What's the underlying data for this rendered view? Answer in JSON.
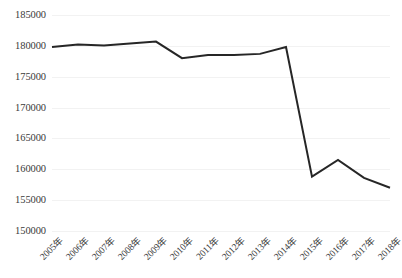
{
  "chart_data": {
    "type": "line",
    "title": "",
    "xlabel": "",
    "ylabel": "",
    "categories": [
      "2005年",
      "2006年",
      "2007年",
      "2008年",
      "2009年",
      "2010年",
      "2011年",
      "2012年",
      "2013年",
      "2014年",
      "2015年",
      "2016年",
      "2017年",
      "2018年"
    ],
    "values": [
      179800,
      180200,
      180050,
      180400,
      180700,
      178000,
      178500,
      178500,
      178700,
      179800,
      158800,
      161500,
      158600,
      157000
    ],
    "series": [
      {
        "name": "",
        "values": [
          179800,
          180200,
          180050,
          180400,
          180700,
          178000,
          178500,
          178500,
          178700,
          179800,
          158800,
          161500,
          158600,
          157000
        ]
      }
    ],
    "ylim": [
      150000,
      185000
    ],
    "ytick_values": [
      185000,
      180000,
      175000,
      170000,
      165000,
      160000,
      155000,
      150000
    ],
    "ytick_labels": [
      "185000",
      "180000",
      "175000",
      "170000",
      "165000",
      "160000",
      "155000",
      "150000"
    ],
    "ytick_step": 5000,
    "grid": true,
    "grid_axis": "y",
    "legend": false,
    "legend_position": "none",
    "line_color": "#262626",
    "grid_color": "#f2f2f2",
    "background_color": "#ffffff",
    "text_color": "#3a3a3a",
    "marker": "none",
    "xtick_rotation": -45
  }
}
